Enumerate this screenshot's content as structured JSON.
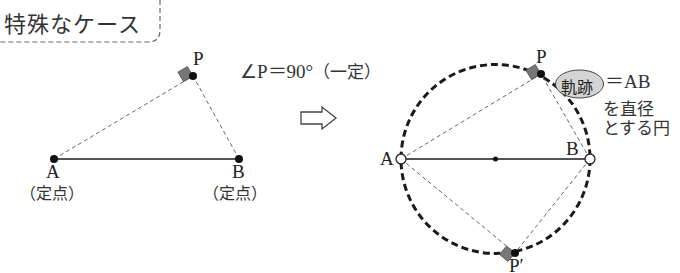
{
  "title": "特殊なケース",
  "left_figure": {
    "point_p": "P",
    "point_a": "A",
    "point_b": "B",
    "fixed_a": "（定点）",
    "fixed_b": "（定点）"
  },
  "condition": {
    "angle": "∠P＝90°",
    "constant": "（一定）"
  },
  "arrow": "⇨",
  "right_figure": {
    "point_p": "P",
    "point_p_prime": "P′",
    "point_a": "A",
    "point_b": "B"
  },
  "locus_note": {
    "badge": "軌跡",
    "equals": "＝AB",
    "line2": "を直径",
    "line3": "とする円"
  },
  "colors": {
    "line": "#1a1a1a",
    "dashed_line": "#666666",
    "right_angle_mark": "#777777",
    "badge_fill": "#d4d4d4"
  }
}
